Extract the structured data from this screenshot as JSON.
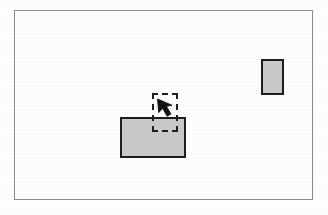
{
  "figure": {
    "title": "Dragging a rectangle toward a target position",
    "width": 328,
    "height": 215,
    "background_color": "#ffffff",
    "frame": {
      "label": "illustration frame",
      "border_color": "#8b8b8b",
      "fill_color": "#fefefe",
      "x": 14,
      "y": 10,
      "width": 299,
      "height": 190
    }
  },
  "shapes": {
    "source_rectangle": {
      "label": "source rectangle",
      "fill_color": "#c9c9c9",
      "border_color": "#1c1c1c",
      "x": 120,
      "y": 117,
      "width": 66,
      "height": 41
    },
    "target_rectangle": {
      "label": "target rectangle",
      "fill_color": "#c9c9c9",
      "border_color": "#1c1c1c",
      "x": 261,
      "y": 59,
      "width": 23,
      "height": 36
    },
    "drag_outline": {
      "label": "dashed drag preview outline",
      "border_color": "#1c1c1c",
      "border_style": "dashed",
      "fill_color": "transparent",
      "x": 152,
      "y": 93,
      "width": 26,
      "height": 39
    },
    "cursor": {
      "label": "arrow pointer",
      "icon": "arrow-pointer-icon",
      "color": "#111111",
      "direction": "up-left",
      "tip_x": 158,
      "tip_y": 100
    }
  }
}
